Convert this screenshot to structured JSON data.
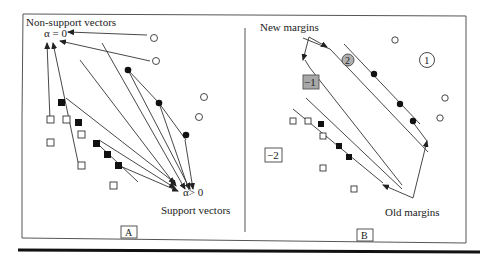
{
  "figure": {
    "panel_a": {
      "label": "A",
      "top_label": "Non-support vectors",
      "top_alpha": "α = 0",
      "bottom_alpha": "α> 0",
      "bottom_label": "Support vectors"
    },
    "panel_b": {
      "label": "B",
      "new_margins_label": "New margins",
      "old_margins_label": "Old margins",
      "region_1": "1",
      "region_2": "2",
      "region_neg1": "−1",
      "region_neg2": "−2"
    }
  },
  "colors": {
    "line": "#333333",
    "filled_point": "#111111",
    "region_neg1_fill": "#a8a8a8",
    "region_2_fill": "#b0b0b0"
  }
}
